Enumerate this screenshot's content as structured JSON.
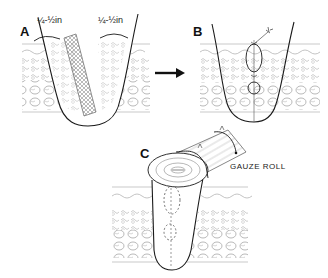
{
  "panels": [
    {
      "label": "A",
      "measure_left": "¼-½in",
      "measure_right": "¼-½in"
    },
    {
      "label": "B"
    },
    {
      "label": "C",
      "caption": "GAUZE ROLL"
    }
  ],
  "colors": {
    "ink": "#1a1a1a",
    "tissue": "#9a9a9a",
    "background": "#ffffff"
  }
}
